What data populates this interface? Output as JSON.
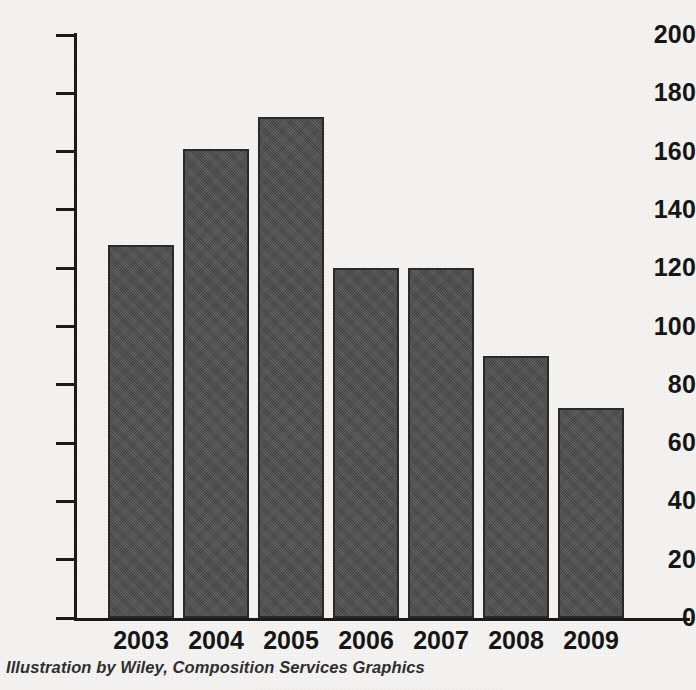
{
  "chart_data": {
    "type": "bar",
    "title": "",
    "subtitle": "",
    "xlabel": "",
    "ylabel": "",
    "categories": [
      "2003",
      "2004",
      "2005",
      "2006",
      "2007",
      "2008",
      "2009"
    ],
    "values": [
      128,
      161,
      172,
      120,
      120,
      90,
      72
    ],
    "ylim": [
      0,
      200
    ],
    "ytick_values": [
      0,
      20,
      40,
      60,
      80,
      100,
      120,
      140,
      160,
      180,
      200
    ],
    "ytick_labels": [
      "0",
      "20",
      "40",
      "60",
      "80",
      "100",
      "120",
      "140",
      "160",
      "180",
      "200"
    ],
    "grid": false,
    "legend": null,
    "legend_position": "none",
    "annotations": [],
    "bar_color": "#4b4b4b",
    "bar_border_color": "#2a2a2a",
    "axis_color": "#1b1b1b",
    "background_color": "#f4f3f1",
    "text_color": "#161616"
  },
  "caption": {
    "text": "Illustration by Wiley, Composition Services Graphics"
  }
}
